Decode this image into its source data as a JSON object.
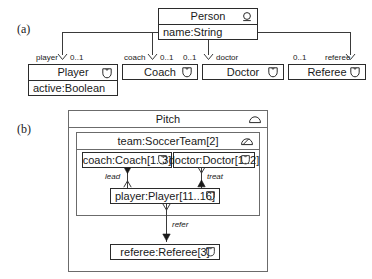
{
  "figure": {
    "panel_a_label": "(a)",
    "panel_b_label": "(b)"
  },
  "panel_a": {
    "superclass": {
      "name": "Person",
      "icon": "role-head-icon",
      "attribute": "name:String"
    },
    "subclasses": [
      {
        "name": "Player",
        "icon": "shield-badge-icon",
        "attribute": "active:Boolean",
        "role": "player",
        "multiplicity": "0..1",
        "role_side": "left"
      },
      {
        "name": "Coach",
        "icon": "shield-badge-icon",
        "attribute": "",
        "role": "coach",
        "multiplicity": "0..1",
        "role_side": "left"
      },
      {
        "name": "Doctor",
        "icon": "shield-badge-icon",
        "attribute": "",
        "role": "doctor",
        "multiplicity": "0..1",
        "role_side": "right"
      },
      {
        "name": "Referee",
        "icon": "shield-badge-icon",
        "attribute": "",
        "role": "referee",
        "multiplicity": "0..1",
        "role_side": "right"
      }
    ]
  },
  "panel_b": {
    "outer": {
      "title": "Pitch",
      "icon": "dome-plain-icon"
    },
    "team": {
      "title": "team:SoccerTeam[2]",
      "icon": "dome-slash-icon"
    },
    "objects": [
      {
        "label": "coach:Coach[1..3]",
        "icon": "shield-badge-icon"
      },
      {
        "label": "doctor:Doctor[1..2]",
        "icon": "shield-badge-icon"
      },
      {
        "label": "player:Player[11..16]",
        "icon": "shield-badge-icon"
      },
      {
        "label": "referee:Referee[3]",
        "icon": "shield-badge-icon"
      }
    ],
    "links": [
      {
        "label": "lead"
      },
      {
        "label": "treat"
      },
      {
        "label": "refer"
      }
    ]
  },
  "colors": {
    "stroke_dark": "#2b2b2b",
    "stroke_mid": "#6b6b6b",
    "background": "#ffffff",
    "text": "#1a1a1a"
  }
}
